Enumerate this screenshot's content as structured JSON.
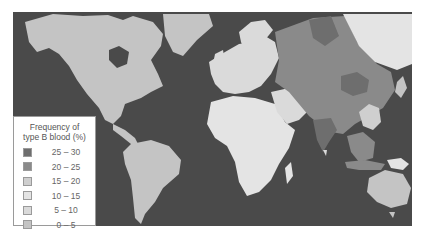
{
  "legend": {
    "title_line1": "Frequency of",
    "title_line2": "type B blood (%)",
    "items": [
      {
        "label": "25 – 30",
        "color": "#6e6e6e"
      },
      {
        "label": "20 – 25",
        "color": "#8a8a8a"
      },
      {
        "label": "15 – 20",
        "color": "#cfcfcf"
      },
      {
        "label": "10 – 15",
        "color": "#e4e4e4"
      },
      {
        "label": "5 – 10",
        "color": "#dadada"
      },
      {
        "label": "0 – 5",
        "color": "#c4c4c4"
      }
    ]
  },
  "colors": {
    "ocean": "#4a4a4a",
    "freq_0_5": "#c4c4c4",
    "freq_5_10": "#dadada",
    "freq_10_15": "#e4e4e4",
    "freq_15_20": "#cfcfcf",
    "freq_20_25": "#8a8a8a",
    "freq_25_30": "#6e6e6e"
  }
}
